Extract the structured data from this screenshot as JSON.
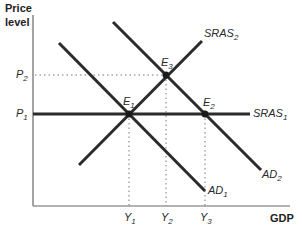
{
  "diagram": {
    "y_axis_title_line1": "Price",
    "y_axis_title_line2": "level",
    "x_axis_title": "GDP",
    "price_levels": [
      {
        "base": "P",
        "sub": "2"
      },
      {
        "base": "P",
        "sub": "1"
      }
    ],
    "output_levels": [
      {
        "base": "Y",
        "sub": "1"
      },
      {
        "base": "Y",
        "sub": "2"
      },
      {
        "base": "Y",
        "sub": "3"
      }
    ],
    "curves": {
      "sras1": {
        "base": "SRAS",
        "sub": "1"
      },
      "sras2": {
        "base": "SRAS",
        "sub": "2"
      },
      "ad1": {
        "base": "AD",
        "sub": "1"
      },
      "ad2": {
        "base": "AD",
        "sub": "2"
      }
    },
    "equilibria": {
      "e1": {
        "base": "E",
        "sub": "1"
      },
      "e2": {
        "base": "E",
        "sub": "2"
      },
      "e3": {
        "base": "E",
        "sub": "3"
      }
    },
    "colors": {
      "curve": "#2b2b2b",
      "axis": "#555555",
      "guide": "#777777"
    }
  }
}
